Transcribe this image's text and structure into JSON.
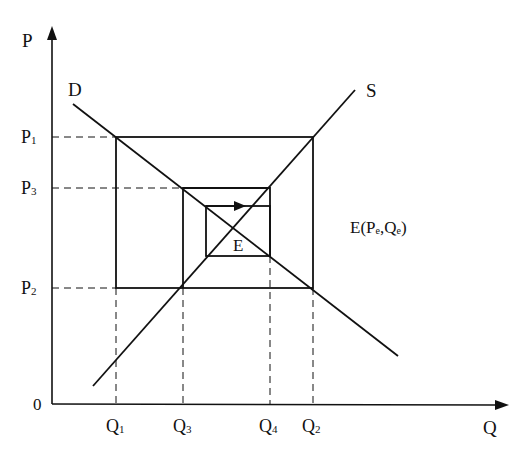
{
  "diagram": {
    "type": "cobweb-model",
    "axes": {
      "y_label": "P",
      "x_label": "Q",
      "origin_label": "0"
    },
    "price_levels": [
      {
        "base": "P",
        "sub": "1",
        "y": 137
      },
      {
        "base": "P",
        "sub": "3",
        "y": 188
      },
      {
        "base": "P",
        "sub": "2",
        "y": 288
      }
    ],
    "quantity_levels": [
      {
        "base": "Q",
        "sub": "1",
        "x": 116
      },
      {
        "base": "Q",
        "sub": "3",
        "x": 183
      },
      {
        "base": "Q",
        "sub": "4",
        "x": 270
      },
      {
        "base": "Q",
        "sub": "2",
        "x": 313
      }
    ],
    "curves": {
      "demand_label": "D",
      "supply_label": "S"
    },
    "equilibrium": {
      "point_label": "E",
      "annotation": "E(P",
      "annotation_sub1": "e",
      "annotation_mid": ",Q",
      "annotation_sub2": "e",
      "annotation_end": ")"
    },
    "colors": {
      "line": "#111111",
      "background": "#ffffff"
    }
  }
}
